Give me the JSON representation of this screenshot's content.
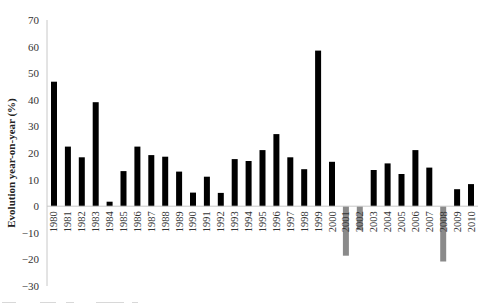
{
  "chart_data": {
    "type": "bar",
    "title": "",
    "xlabel": "",
    "ylabel": "Evolution year-on-year (%)",
    "ylim": [
      -30,
      70
    ],
    "yticks": [
      70,
      60,
      50,
      40,
      30,
      20,
      10,
      0,
      -10,
      -20,
      -30
    ],
    "grid": false,
    "legend": "none",
    "colors": {
      "positive": "#000000",
      "negative": "#8a8a8a",
      "axis": "#c8c8c8"
    },
    "categories": [
      "1980",
      "1981",
      "1982",
      "1983",
      "1984",
      "1985",
      "1986",
      "1987",
      "1988",
      "1989",
      "1990",
      "1991",
      "1992",
      "1993",
      "1994",
      "1995",
      "1996",
      "1997",
      "1998",
      "1999",
      "2000",
      "2001",
      "2002",
      "2003",
      "2004",
      "2005",
      "2006",
      "2007",
      "2008",
      "2009",
      "2010"
    ],
    "values": [
      46.8,
      22.4,
      18.4,
      39.1,
      1.7,
      13.2,
      22.4,
      19.2,
      18.6,
      13.0,
      5.1,
      11.1,
      5.0,
      17.7,
      17.0,
      21.1,
      27.1,
      18.4,
      13.9,
      58.5,
      16.7,
      -18.6,
      -9.0,
      13.6,
      16.1,
      12.1,
      21.1,
      14.5,
      -20.8,
      6.4,
      8.3
    ]
  }
}
